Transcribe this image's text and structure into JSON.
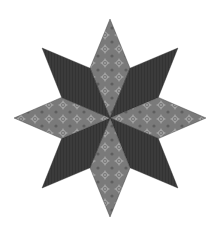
{
  "image": {
    "title": "Eight-pointed star quilt block",
    "description": "LeMoyne star made of 8 diamond patches alternating patterned light-gray fabric and solid dark-charcoal fabric"
  },
  "star": {
    "points": 8,
    "patches": [
      {
        "direction": "top",
        "fabric": "light"
      },
      {
        "direction": "top-right",
        "fabric": "dark"
      },
      {
        "direction": "right",
        "fabric": "light"
      },
      {
        "direction": "bottom-right",
        "fabric": "dark"
      },
      {
        "direction": "bottom",
        "fabric": "light"
      },
      {
        "direction": "bottom-left",
        "fabric": "dark"
      },
      {
        "direction": "left",
        "fabric": "light"
      },
      {
        "direction": "top-left",
        "fabric": "dark"
      }
    ]
  },
  "colors": {
    "background": "#ffffff",
    "light_fabric": "#7a7a7a",
    "light_fabric_motif": "#a6a6a6",
    "light_fabric_shadow": "#5e5e5e",
    "dark_fabric": "#3b3b3b",
    "dark_fabric_texture": "#333333",
    "seam": "#2a2a2a"
  }
}
